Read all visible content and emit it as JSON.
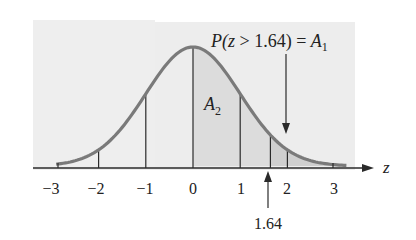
{
  "figure": {
    "title_annotation": {
      "prefix": "P(",
      "var": "z",
      "relation": " > 1.64) = ",
      "result_var": "A",
      "result_sub": "1"
    },
    "region_label": {
      "var": "A",
      "sub": "2"
    },
    "axis_label": "z",
    "tick_labels": [
      "−3",
      "−2",
      "−1",
      "0",
      "1",
      "2",
      "3"
    ],
    "marker_label": "1.64",
    "colors": {
      "background_panel": "#ececec",
      "curve": "#7a7a7a",
      "shade_A2": "#dcdcdc",
      "shade_A1": "#cfcfcf",
      "lines": "#2a2a2a"
    }
  },
  "chart_data": {
    "type": "area",
    "title": "P(z > 1.64) = A1",
    "xlabel": "z",
    "ylabel": "",
    "x_ticks": [
      -3,
      -2,
      -1,
      0,
      1,
      2,
      3
    ],
    "tick_labels": [
      "-3",
      "-2",
      "-1",
      "0",
      "1",
      "2",
      "3"
    ],
    "curve": "standard normal density",
    "vertical_lines_at": [
      -2,
      -1,
      0,
      1,
      1.64,
      2
    ],
    "shaded_regions": [
      {
        "name": "A2",
        "from": 0,
        "to": 1.64
      },
      {
        "name": "A1",
        "from": 1.64,
        "to": "inf"
      }
    ],
    "annotations": [
      {
        "text": "P(z > 1.64) = A1",
        "arrow_to_x": 2
      },
      {
        "text": "1.64",
        "arrow_to_x": 1.64
      },
      {
        "text": "A2",
        "x": 0.8
      }
    ],
    "xlim": [
      -3.3,
      3.8
    ],
    "grid": false
  }
}
